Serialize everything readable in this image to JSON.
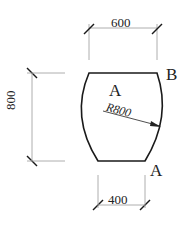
{
  "diagram": {
    "dimensions": {
      "top_width": "600",
      "bottom_width": "400",
      "height": "800",
      "radius": "R800"
    },
    "labels": {
      "center": "A",
      "top_right_corner": "B",
      "bottom_right_corner": "A"
    },
    "colors": {
      "outline": "#1a1a1a",
      "dim_line": "#999999",
      "text": "#222222"
    }
  }
}
